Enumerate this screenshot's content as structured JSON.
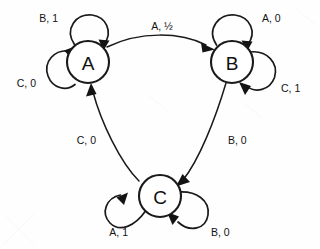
{
  "diagram": {
    "type": "state-transition-diagram",
    "states": [
      {
        "id": "A",
        "label": "A",
        "cx": 88,
        "cy": 62,
        "r": 21
      },
      {
        "id": "B",
        "label": "B",
        "cx": 232,
        "cy": 62,
        "r": 21
      },
      {
        "id": "C",
        "label": "C",
        "cx": 160,
        "cy": 196,
        "r": 21
      }
    ],
    "transitions": [
      {
        "from": "A",
        "to": "B",
        "label": "A, ½",
        "label_x": 162,
        "label_y": 26
      },
      {
        "from": "B",
        "to": "C",
        "label": "B, 0",
        "label_x": 232,
        "label_y": 140
      },
      {
        "from": "C",
        "to": "A",
        "label": "C, 0",
        "label_x": 87,
        "label_y": 140
      }
    ],
    "self_loops": [
      {
        "state": "A",
        "label": "B, 1",
        "position": "top-left",
        "label_x": 46,
        "label_y": 18
      },
      {
        "state": "A",
        "label": "C, 0",
        "position": "left",
        "label_x": 22,
        "label_y": 83
      },
      {
        "state": "B",
        "label": "A, 0",
        "position": "top-right",
        "label_x": 273,
        "label_y": 18
      },
      {
        "state": "B",
        "label": "C, 1",
        "position": "right",
        "label_x": 293,
        "label_y": 88
      },
      {
        "state": "C",
        "label": "A, 1",
        "position": "bottom-left",
        "label_x": 113,
        "label_y": 232
      },
      {
        "state": "C",
        "label": "B, 0",
        "position": "bottom-right",
        "label_x": 222,
        "label_y": 232
      }
    ],
    "colors": {
      "ink": "#1a1a1a",
      "background": "#fefefe",
      "node_fill": "#ffffff"
    }
  }
}
